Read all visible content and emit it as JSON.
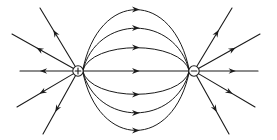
{
  "figure": {
    "name": "electric-dipole-field-lines",
    "background_color": "#ffffff",
    "line_color": "#1a1a1a",
    "width": 277,
    "height": 140
  },
  "charges": [
    {
      "id": "positive-charge",
      "sign": "+",
      "label": "+",
      "cx": 78,
      "cy": 71,
      "r": 5.2
    },
    {
      "id": "negative-charge",
      "sign": "−",
      "label": "−",
      "cx": 194,
      "cy": 71,
      "r": 5.2
    }
  ],
  "connecting_field_lines": {
    "count": 7,
    "direction": "positive-to-negative",
    "arrow_direction": "right",
    "lines": [
      {
        "id": "arc-upper-3",
        "apex_y": 8,
        "side": "above",
        "arrow_x": 136,
        "arrow_y": 8
      },
      {
        "id": "arc-upper-2",
        "apex_y": 27,
        "side": "above",
        "arrow_x": 136,
        "arrow_y": 27
      },
      {
        "id": "arc-upper-1",
        "apex_y": 47,
        "side": "above",
        "arrow_x": 136,
        "arrow_y": 47
      },
      {
        "id": "axis-center",
        "apex_y": 71,
        "side": "center",
        "arrow_x": 136,
        "arrow_y": 71
      },
      {
        "id": "arc-lower-1",
        "apex_y": 95,
        "side": "below",
        "arrow_x": 136,
        "arrow_y": 95
      },
      {
        "id": "arc-lower-2",
        "apex_y": 114,
        "side": "below",
        "arrow_x": 136,
        "arrow_y": 114
      },
      {
        "id": "arc-lower-3",
        "apex_y": 132,
        "side": "below",
        "arrow_x": 136,
        "arrow_y": 132
      }
    ]
  },
  "radial_field_lines": {
    "positive_fan": {
      "origin": "positive-charge",
      "arrow_direction": "outward",
      "count": 5,
      "lines": [
        {
          "id": "pos-ray-upper-steep",
          "x2": 40,
          "y2": 8,
          "arrow_t": 0.62
        },
        {
          "id": "pos-ray-upper-shallow",
          "x2": 12,
          "y2": 34,
          "arrow_t": 0.6
        },
        {
          "id": "pos-ray-horizontal",
          "x2": 20,
          "y2": 71,
          "arrow_t": 0.62
        },
        {
          "id": "pos-ray-lower-shallow",
          "x2": 17,
          "y2": 107,
          "arrow_t": 0.6
        },
        {
          "id": "pos-ray-lower-steep",
          "x2": 43,
          "y2": 134,
          "arrow_t": 0.62
        }
      ]
    },
    "negative_fan": {
      "origin": "negative-charge",
      "arrow_direction": "outward",
      "count": 5,
      "lines": [
        {
          "id": "neg-ray-upper-steep",
          "x2": 232,
          "y2": 8,
          "arrow_t": 0.62
        },
        {
          "id": "neg-ray-upper-shallow",
          "x2": 260,
          "y2": 34,
          "arrow_t": 0.6
        },
        {
          "id": "neg-ray-horizontal",
          "x2": 258,
          "y2": 71,
          "arrow_t": 0.62
        },
        {
          "id": "neg-ray-lower-shallow",
          "x2": 255,
          "y2": 107,
          "arrow_t": 0.6
        },
        {
          "id": "neg-ray-lower-steep",
          "x2": 229,
          "y2": 134,
          "arrow_t": 0.62
        }
      ]
    }
  }
}
